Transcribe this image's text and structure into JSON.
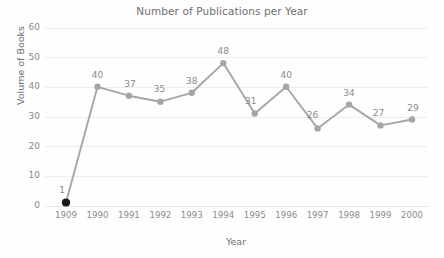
{
  "chart_data": {
    "type": "line",
    "title": "Number of Publications per Year",
    "xlabel": "Year",
    "ylabel": "Volume of Books",
    "categories": [
      "1909",
      "1990",
      "1991",
      "1992",
      "1993",
      "1994",
      "1995",
      "1996",
      "1997",
      "1998",
      "1999",
      "2000"
    ],
    "values": [
      1,
      40,
      37,
      35,
      38,
      48,
      31,
      40,
      26,
      34,
      27,
      29
    ],
    "data_labels": [
      "1",
      "40",
      "37",
      "35",
      "38",
      "48",
      "31",
      "40",
      "26",
      "34",
      "27",
      "29"
    ],
    "ylim": [
      0,
      60
    ],
    "ytick_values": [
      0,
      10,
      20,
      30,
      40,
      50,
      60
    ],
    "ytick_labels": [
      "0",
      "10",
      "20",
      "30",
      "40",
      "50",
      "60"
    ],
    "grid": true,
    "legend": false,
    "series_color": "#a6a6a6",
    "first_marker_color": "#1a1a1a",
    "gridline_color": "#ededed",
    "label_color": "#8a8a8a",
    "background_color": "#fefefe"
  }
}
